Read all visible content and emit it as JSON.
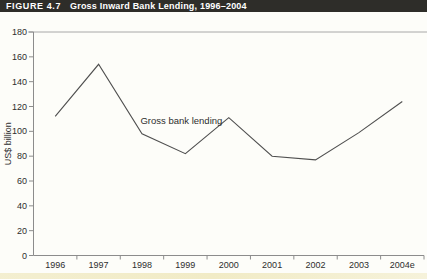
{
  "header": {
    "figure_label": "FIGURE 4.7",
    "figure_title": "Gross Inward Bank Lending, 1996–2004"
  },
  "chart_data": {
    "type": "line",
    "title": "Gross Inward Bank Lending, 1996–2004",
    "categories": [
      "1996",
      "1997",
      "1998",
      "1999",
      "2000",
      "2001",
      "2002",
      "2003",
      "2004e"
    ],
    "series": [
      {
        "name": "Gross bank lending",
        "values": [
          112,
          154,
          98,
          82,
          111,
          80,
          77,
          99,
          124
        ]
      }
    ],
    "annotation": "Gross bank lending",
    "xlabel": "",
    "ylabel": "US$ billion",
    "ylim": [
      0,
      180
    ],
    "ytick_interval": 20,
    "yticks": [
      0,
      20,
      40,
      60,
      80,
      100,
      120,
      140,
      160,
      180
    ],
    "grid": false,
    "legend": "none"
  },
  "colors": {
    "header_bg": "#2e2d29",
    "header_text": "#ffffff",
    "axis": "#8c8c8c",
    "plot_top_line": "#a8a8a8",
    "series_line": "#4f4f4f",
    "label_text": "#2e2e2e",
    "page_bg": "#fdfdf9",
    "bottom_strip": "#f1ebc6"
  }
}
